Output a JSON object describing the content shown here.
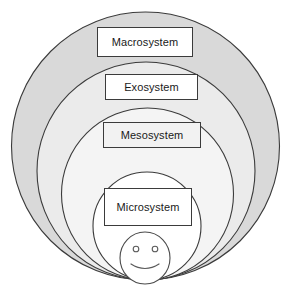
{
  "diagram": {
    "type": "nested-circles",
    "canvas": {
      "width": 290,
      "height": 294
    },
    "colors": {
      "macro_fill": "#d9d9d9",
      "exo_fill": "#ebebeb",
      "meso_fill": "#f4f4f4",
      "micro_fill": "#ffffff",
      "stroke": "#3b3b3b",
      "box_fill": "#ffffff",
      "box_tint": "#f2f2f2",
      "text": "#1a1a1a",
      "background": "#ffffff"
    },
    "layers": [
      {
        "id": "macrosystem",
        "label": "Macrosystem",
        "level": 1,
        "fill": "#d9d9d9",
        "circle": {
          "cx": 145.5,
          "cy": 146,
          "r": 134
        }
      },
      {
        "id": "exosystem",
        "label": "Exosystem",
        "level": 2,
        "fill": "#ebebeb",
        "circle": {
          "cx": 146,
          "cy": 171,
          "r": 109
        }
      },
      {
        "id": "mesosystem",
        "label": "Mesosystem",
        "level": 3,
        "fill": "#f4f4f4",
        "circle": {
          "cx": 147.5,
          "cy": 194,
          "r": 86
        }
      },
      {
        "id": "microsystem",
        "label": "Microsystem",
        "level": 4,
        "fill": "#ffffff",
        "circle": {
          "cx": 147,
          "cy": 226,
          "r": 54
        }
      }
    ],
    "figure": {
      "id": "child-smiley-face",
      "description": "smiley face representing the individual child",
      "head": {
        "cx": 145,
        "cy": 258,
        "rx": 25,
        "ry": 26
      },
      "eyes": [
        {
          "cx": 136,
          "cy": 249,
          "r": 2.8
        },
        {
          "cx": 155,
          "cy": 249,
          "r": 2.8
        }
      ],
      "mouth": "smile-arc"
    }
  }
}
